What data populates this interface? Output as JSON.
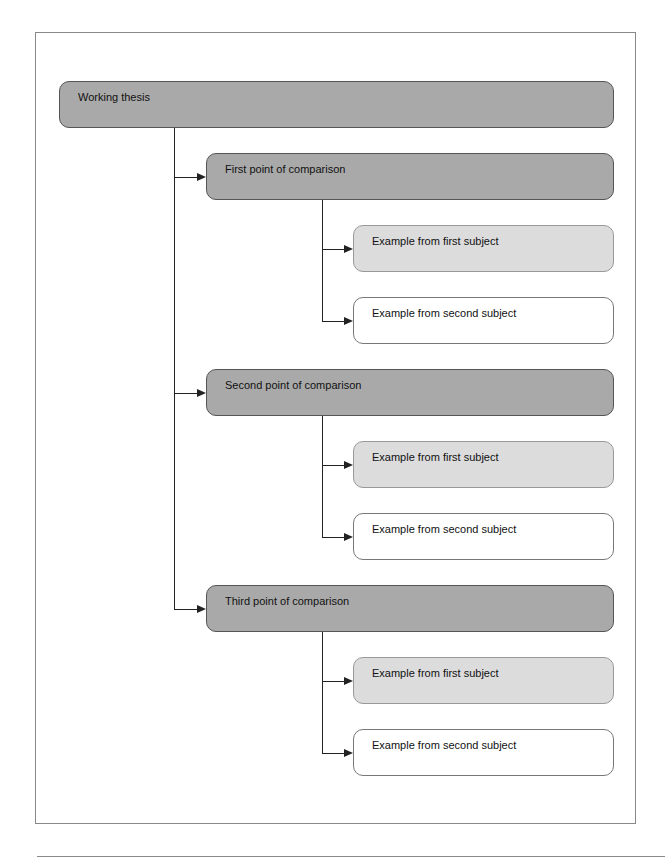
{
  "diagram": {
    "thesis": "Working thesis",
    "points": [
      {
        "label": "First point of comparison",
        "examples": [
          "Example from first subject",
          "Example from second subject"
        ]
      },
      {
        "label": "Second point of comparison",
        "examples": [
          "Example from first subject",
          "Example from second subject"
        ]
      },
      {
        "label": "Third point of comparison",
        "examples": [
          "Example from first subject",
          "Example from second subject"
        ]
      }
    ]
  },
  "colors": {
    "point_fill": "#a9a9a9",
    "first_example_fill": "#dcdcdc",
    "second_example_fill": "#ffffff",
    "line": "#222222"
  }
}
